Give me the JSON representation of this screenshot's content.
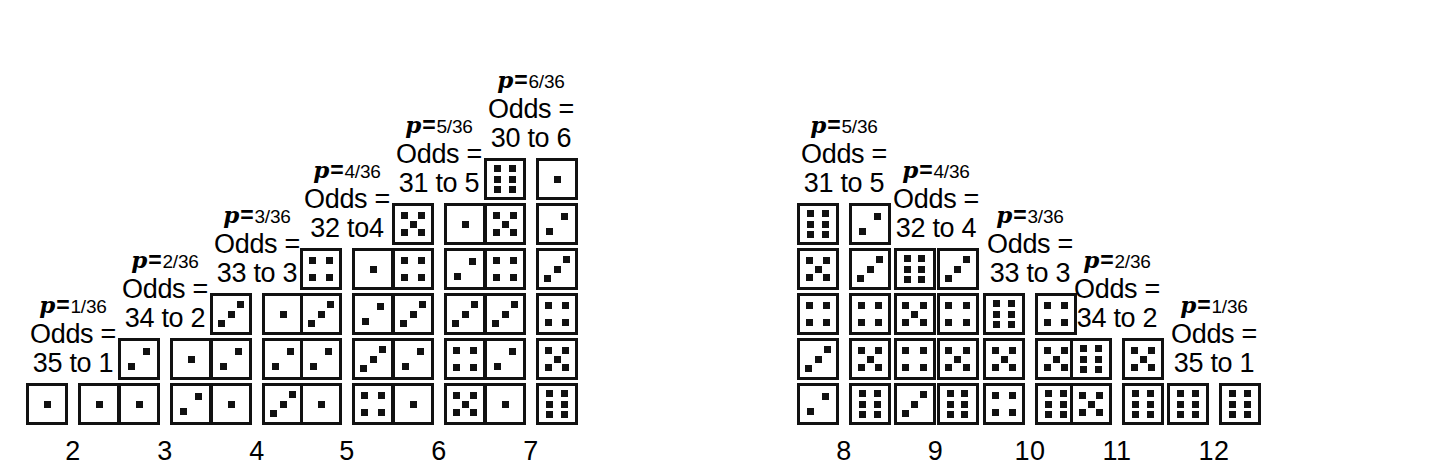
{
  "colors": {
    "ink": "#111111",
    "background": "#ffffff"
  },
  "chart_data": {
    "type": "bar",
    "xlabel": "Sum of two dice",
    "ylabel": "Number of outcomes",
    "categories": [
      "2",
      "3",
      "4",
      "5",
      "6",
      "7",
      "8",
      "9",
      "10",
      "11",
      "12"
    ],
    "values": [
      1,
      2,
      3,
      4,
      5,
      6,
      5,
      4,
      3,
      2,
      1
    ],
    "ylim": [
      0,
      6
    ],
    "grid": false,
    "legend": null,
    "denominator": 36,
    "probabilities": [
      "1/36",
      "2/36",
      "3/36",
      "4/36",
      "5/36",
      "6/36",
      "5/36",
      "4/36",
      "3/36",
      "2/36",
      "1/36"
    ],
    "odds": [
      "35 to 1",
      "34 to 2",
      "33 to 3",
      "32 to4",
      "31 to 5",
      "30 to 6",
      "31 to 5",
      "32 to 4",
      "33 to 3",
      "34 to 2",
      "35 to 1"
    ]
  },
  "columns": [
    {
      "sum": "2",
      "p_var": "p",
      "p_eq": "=",
      "p_frac": "1/36",
      "odds_word": "Odds =",
      "odds_value": "35 to 1",
      "left": 26,
      "tight": false,
      "pairs": [
        [
          1,
          1
        ]
      ]
    },
    {
      "sum": "3",
      "p_var": "p",
      "p_eq": "=",
      "p_frac": "2/36",
      "odds_word": "Odds =",
      "odds_value": "34 to 2",
      "left": 118,
      "tight": false,
      "pairs": [
        [
          2,
          1
        ],
        [
          1,
          2
        ]
      ]
    },
    {
      "sum": "4",
      "p_var": "p",
      "p_eq": "=",
      "p_frac": "3/36",
      "odds_word": "Odds =",
      "odds_value": "33 to 3",
      "left": 210,
      "tight": false,
      "pairs": [
        [
          3,
          1
        ],
        [
          2,
          2
        ],
        [
          1,
          3
        ]
      ]
    },
    {
      "sum": "5",
      "p_var": "p",
      "p_eq": "=",
      "p_frac": "4/36",
      "odds_word": "Odds =",
      "odds_value": "32 to4",
      "left": 300,
      "tight": false,
      "pairs": [
        [
          4,
          1
        ],
        [
          3,
          2
        ],
        [
          2,
          3
        ],
        [
          1,
          4
        ]
      ]
    },
    {
      "sum": "6",
      "p_var": "p",
      "p_eq": "=",
      "p_frac": "5/36",
      "odds_word": "Odds =",
      "odds_value": "31 to 5",
      "left": 392,
      "tight": false,
      "pairs": [
        [
          5,
          1
        ],
        [
          4,
          2
        ],
        [
          3,
          3
        ],
        [
          2,
          4
        ],
        [
          1,
          5
        ]
      ]
    },
    {
      "sum": "7",
      "p_var": "p",
      "p_eq": "=",
      "p_frac": "6/36",
      "odds_word": "Odds =",
      "odds_value": "30 to 6",
      "left": 484,
      "tight": false,
      "pairs": [
        [
          6,
          1
        ],
        [
          5,
          2
        ],
        [
          4,
          3
        ],
        [
          3,
          4
        ],
        [
          2,
          5
        ],
        [
          1,
          6
        ]
      ]
    },
    {
      "sum": "8",
      "p_var": "p",
      "p_eq": "=",
      "p_frac": "5/36",
      "odds_word": "Odds =",
      "odds_value": "31 to 5",
      "left": 797,
      "tight": false,
      "pairs": [
        [
          6,
          2
        ],
        [
          5,
          3
        ],
        [
          4,
          4
        ],
        [
          3,
          5
        ],
        [
          2,
          6
        ]
      ]
    },
    {
      "sum": "9",
      "p_var": "p",
      "p_eq": "=",
      "p_frac": "4/36",
      "odds_word": "Odds =",
      "odds_value": "32 to 4",
      "left": 893,
      "tight": true,
      "pairs": [
        [
          6,
          3
        ],
        [
          5,
          4
        ],
        [
          4,
          5
        ],
        [
          3,
          6
        ]
      ]
    },
    {
      "sum": "10",
      "p_var": "p",
      "p_eq": "=",
      "p_frac": "3/36",
      "odds_word": "Odds =",
      "odds_value": "33 to 3",
      "left": 983,
      "tight": false,
      "pairs": [
        [
          6,
          4
        ],
        [
          5,
          5
        ],
        [
          4,
          6
        ]
      ]
    },
    {
      "sum": "11",
      "p_var": "p",
      "p_eq": "=",
      "p_frac": "2/36",
      "odds_word": "Odds =",
      "odds_value": "34 to 2",
      "left": 1070,
      "tight": false,
      "pairs": [
        [
          6,
          5
        ],
        [
          5,
          6
        ]
      ]
    },
    {
      "sum": "12",
      "p_var": "p",
      "p_eq": "=",
      "p_frac": "1/36",
      "odds_word": "Odds =",
      "odds_value": "35 to 1",
      "left": 1167,
      "tight": false,
      "pairs": [
        [
          6,
          6
        ]
      ]
    }
  ]
}
